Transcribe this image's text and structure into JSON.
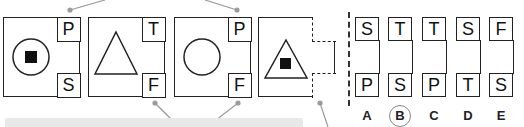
{
  "puzzle": {
    "sequence": [
      {
        "shape": "circle-with-square",
        "top_letter": "P",
        "bottom_letter": "S"
      },
      {
        "shape": "triangle",
        "top_letter": "T",
        "bottom_letter": "F"
      },
      {
        "shape": "circle",
        "top_letter": "P",
        "bottom_letter": "F"
      },
      {
        "shape": "triangle-with-square",
        "top_letter": "",
        "bottom_letter": "",
        "missing": true
      }
    ],
    "options": [
      {
        "label": "A",
        "top": "S",
        "bottom": "P"
      },
      {
        "label": "B",
        "top": "T",
        "bottom": "S",
        "selected": true
      },
      {
        "label": "C",
        "top": "T",
        "bottom": "P"
      },
      {
        "label": "D",
        "top": "S",
        "bottom": "T"
      },
      {
        "label": "E",
        "top": "F",
        "bottom": "S"
      }
    ]
  },
  "colors": {
    "stroke": "#222222",
    "connector": "#999999",
    "bar": "#e8e8e8"
  }
}
